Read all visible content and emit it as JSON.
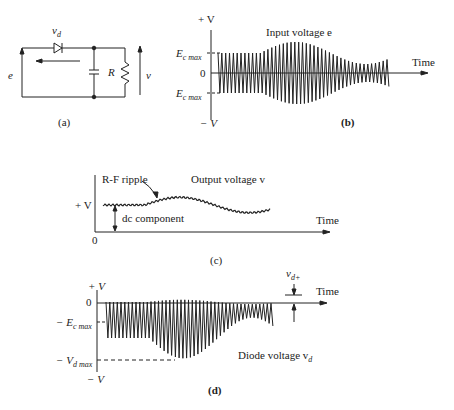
{
  "figure_a": {
    "label": "(a)",
    "diode_voltage": "v",
    "diode_voltage_sub": "d",
    "input": "e",
    "resistor": "R",
    "output": "v"
  },
  "figure_b": {
    "label": "(b)",
    "title": "Input voltage e",
    "plus_v": "+ V",
    "minus_v": "− V",
    "ec_max_top": "E",
    "ec_max_bottom": "E",
    "ec_sub": "c max",
    "zero": "0",
    "time": "Time"
  },
  "figure_c": {
    "label": "(c)",
    "ripple": "R-F ripple",
    "title": "Output voltage v",
    "plus_v": "+ V",
    "dc": "dc component",
    "zero": "0",
    "time": "Time"
  },
  "figure_d": {
    "label": "(d)",
    "plus_v": "+ V",
    "zero": "0",
    "ec_max": "− E",
    "ec_sub": "c max",
    "vd_max": "− V",
    "vd_sub": "d max",
    "minus_v": "− V",
    "vd_plus": "v",
    "vd_plus_sub": "d+",
    "title": "Diode voltage v",
    "title_sub": "d",
    "time": "Time"
  }
}
